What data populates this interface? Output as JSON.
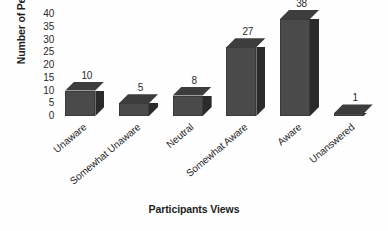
{
  "chart_data": {
    "type": "bar",
    "title": "",
    "xlabel": "Participants Views",
    "ylabel": "Number of Persons",
    "categories": [
      "Unaware",
      "Somewhat Unaware",
      "Neutral",
      "Somewhat Aware",
      "Aware",
      "Unanswered"
    ],
    "values": [
      10,
      5,
      8,
      27,
      38,
      1
    ],
    "value_labels": [
      "10",
      "5",
      "8",
      "27",
      "38",
      "1"
    ],
    "ylim": [
      0,
      40
    ],
    "yticks": [
      0,
      5,
      10,
      15,
      20,
      25,
      30,
      35,
      40
    ],
    "ytick_labels": [
      "0",
      "5",
      "10",
      "15",
      "20",
      "25",
      "30",
      "35",
      "40"
    ],
    "grid": false,
    "legend": false,
    "style": "3d-bar",
    "colors": {
      "bar_front": "#4a4a4a",
      "bar_side": "#2b2b2b",
      "bar_top": "#3d3d3d",
      "background": "#ffffff",
      "text": "#231f20"
    }
  }
}
